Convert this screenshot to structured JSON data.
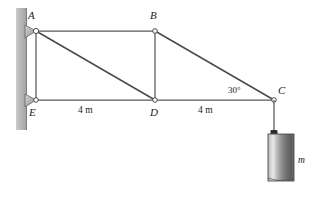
{
  "figure": {
    "background_color": "#ffffff",
    "member_color": "#5a5a5a",
    "wall_color": "#b0b0b0",
    "joint_fill": "#ffffff",
    "support_fill": "#b8b8b8",
    "cylinder_color": "#8a8a8a"
  },
  "nodes": [
    {
      "id": "A",
      "label": "A",
      "x": 36,
      "y": 31
    },
    {
      "id": "B",
      "label": "B",
      "x": 155,
      "y": 31
    },
    {
      "id": "C",
      "label": "C",
      "x": 274,
      "y": 100
    },
    {
      "id": "D",
      "label": "D",
      "x": 155,
      "y": 100
    },
    {
      "id": "E",
      "label": "E",
      "x": 36,
      "y": 100
    }
  ],
  "members": [
    {
      "from": "A",
      "to": "B"
    },
    {
      "from": "A",
      "to": "E"
    },
    {
      "from": "A",
      "to": "D"
    },
    {
      "from": "B",
      "to": "D"
    },
    {
      "from": "B",
      "to": "C"
    },
    {
      "from": "E",
      "to": "D"
    },
    {
      "from": "D",
      "to": "C"
    }
  ],
  "dimensions": [
    {
      "id": "ED",
      "label": "4 m",
      "x": 78,
      "y": 108
    },
    {
      "id": "DC",
      "label": "4 m",
      "x": 198,
      "y": 108
    }
  ],
  "angles": [
    {
      "id": "BCD",
      "label": "30°",
      "x": 229,
      "y": 88
    }
  ],
  "supports": [
    {
      "id": "support-A",
      "node": "A",
      "type": "pin"
    },
    {
      "id": "support-E",
      "node": "E",
      "type": "pin"
    }
  ],
  "load": {
    "label": "m",
    "label_x": 295,
    "label_y": 160,
    "cable_from_x": 274,
    "cable_from_y": 100,
    "cable_to_y": 133,
    "cylinder": {
      "x": 268,
      "y": 133,
      "width": 26,
      "height": 48
    }
  },
  "wall": {
    "x": 16,
    "y": 8,
    "width": 11,
    "height": 122
  }
}
